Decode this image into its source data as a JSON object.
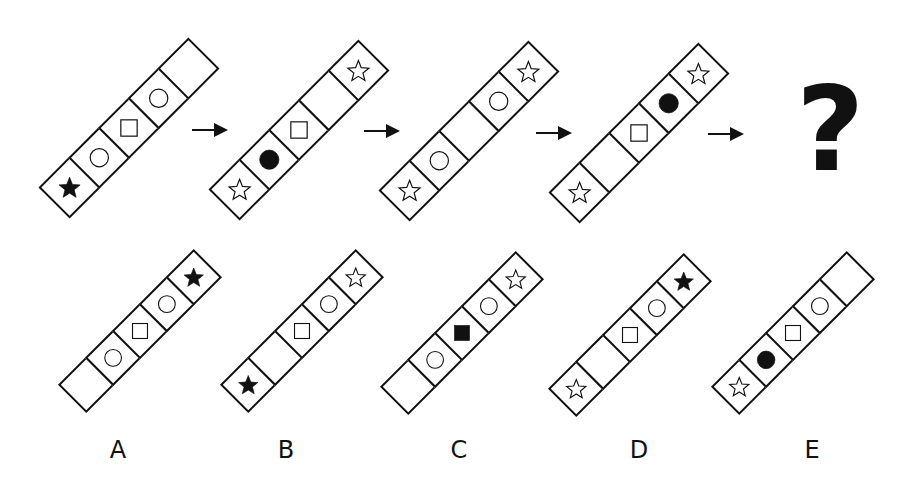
{
  "puzzle": {
    "sequence": [
      {
        "id": "seq-1",
        "cells": [
          "star-filled",
          "circle-outline",
          "square-outline",
          "circle-outline",
          "empty"
        ]
      },
      {
        "id": "seq-2",
        "cells": [
          "star-outline",
          "circle-filled",
          "square-outline",
          "empty",
          "star-outline"
        ]
      },
      {
        "id": "seq-3",
        "cells": [
          "star-outline",
          "circle-outline",
          "empty",
          "circle-outline",
          "star-outline"
        ]
      },
      {
        "id": "seq-4",
        "cells": [
          "star-outline",
          "empty",
          "square-outline",
          "circle-filled",
          "star-outline"
        ]
      }
    ],
    "unknown_symbol": "?",
    "arrow_icon": "arrow-right-icon"
  },
  "options": [
    {
      "label": "A",
      "cells": [
        "empty",
        "circle-outline",
        "square-outline",
        "circle-outline",
        "star-filled"
      ]
    },
    {
      "label": "B",
      "cells": [
        "star-filled",
        "empty",
        "square-outline",
        "circle-outline",
        "star-outline"
      ]
    },
    {
      "label": "C",
      "cells": [
        "empty",
        "circle-outline",
        "square-filled",
        "circle-outline",
        "star-outline"
      ]
    },
    {
      "label": "D",
      "cells": [
        "star-outline",
        "empty",
        "square-outline",
        "circle-outline",
        "star-filled"
      ]
    },
    {
      "label": "E",
      "cells": [
        "star-outline",
        "circle-filled",
        "square-outline",
        "circle-outline",
        "empty"
      ]
    }
  ],
  "colors": {
    "ink": "#111111",
    "background": "#ffffff"
  }
}
